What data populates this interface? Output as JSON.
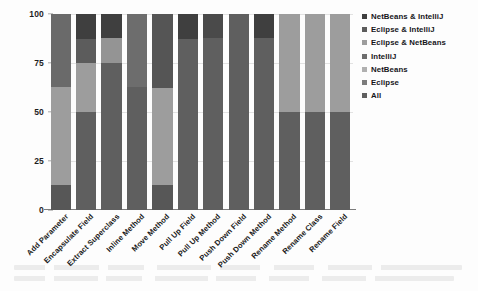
{
  "chart_data": {
    "type": "bar",
    "title": "",
    "subtitle": "",
    "xlabel": "",
    "ylabel": "",
    "ylim": [
      0,
      100
    ],
    "grid": true,
    "stacked": true,
    "stack_mode": "percent",
    "legend_position": "right",
    "orientation": "vertical",
    "yticks": [
      0,
      25,
      50,
      75,
      100
    ],
    "ytick_labels": [
      "0",
      "25",
      "50",
      "75",
      "100"
    ],
    "categories": [
      "Add Parameter",
      "Encapsulate Field",
      "Extract Superclass",
      "Inline Method",
      "Move Method",
      "Pull Up Field",
      "Pull Up Method",
      "Push Down Field",
      "Push Down Method",
      "Rename Method",
      "Rename Class",
      "Rename Field"
    ],
    "series": [
      {
        "name": "NetBeans & IntelliJ",
        "color": "#3a3a3a",
        "values": [
          0,
          13,
          12,
          0,
          0,
          13,
          0,
          0,
          12,
          0,
          0,
          0
        ]
      },
      {
        "name": "Eclipse & IntelliJ",
        "color": "#555555",
        "values": [
          0,
          12,
          0,
          0,
          0,
          0,
          0,
          0,
          0,
          0,
          0,
          0
        ]
      },
      {
        "name": "Eclipse & NetBeans",
        "color": "#9a9a9a",
        "values": [
          0,
          0,
          13,
          0,
          0,
          0,
          0,
          0,
          0,
          0,
          0,
          0
        ]
      },
      {
        "name": "IntelliJ",
        "color": "#6f6f6f",
        "values": [
          0,
          0,
          0,
          12,
          38,
          0,
          12,
          0,
          0,
          0,
          0,
          0
        ]
      },
      {
        "name": "NetBeans",
        "color": "#b4b4b4",
        "values": [
          0,
          0,
          0,
          0,
          0,
          0,
          0,
          0,
          0,
          0,
          0,
          0
        ]
      },
      {
        "name": "Eclipse",
        "color": "#8c8c8c",
        "values": [
          50,
          0,
          0,
          0,
          0,
          0,
          0,
          0,
          0,
          0,
          0,
          0
        ]
      },
      {
        "name": "All",
        "color": "#6a6a6a",
        "values": [
          50,
          75,
          75,
          88,
          62,
          87,
          88,
          100,
          88,
          100,
          100,
          100
        ]
      }
    ],
    "bars": [
      {
        "category": "Add Parameter",
        "segments": [
          {
            "series": "Eclipse",
            "value": 37,
            "from": 100,
            "to": 63,
            "color": "#6a6a6a"
          },
          {
            "series": "All",
            "value": 50,
            "from": 63,
            "to": 13,
            "color": "#9d9d9d"
          },
          {
            "series": "NetBeans & IntelliJ",
            "value": 13,
            "from": 13,
            "to": 0,
            "color": "#575757"
          }
        ]
      },
      {
        "category": "Encapsulate Field",
        "segments": [
          {
            "series": "NetBeans & IntelliJ",
            "value": 13,
            "from": 100,
            "to": 87,
            "color": "#3f3f3f"
          },
          {
            "series": "Eclipse & IntelliJ",
            "value": 12,
            "from": 87,
            "to": 75,
            "color": "#5c5c5c"
          },
          {
            "series": "Eclipse & NetBeans",
            "value": 25,
            "from": 75,
            "to": 50,
            "color": "#9d9d9d"
          },
          {
            "series": "All",
            "value": 50,
            "from": 50,
            "to": 0,
            "color": "#5f5f5f"
          }
        ]
      },
      {
        "category": "Extract Superclass",
        "segments": [
          {
            "series": "NetBeans & IntelliJ",
            "value": 12,
            "from": 100,
            "to": 88,
            "color": "#3f3f3f"
          },
          {
            "series": "Eclipse & NetBeans",
            "value": 13,
            "from": 88,
            "to": 75,
            "color": "#949494"
          },
          {
            "series": "All",
            "value": 75,
            "from": 75,
            "to": 0,
            "color": "#5f5f5f"
          }
        ]
      },
      {
        "category": "Inline Method",
        "segments": [
          {
            "series": "IntelliJ",
            "value": 37,
            "from": 100,
            "to": 63,
            "color": "#6d6d6d"
          },
          {
            "series": "All",
            "value": 63,
            "from": 63,
            "to": 0,
            "color": "#5f5f5f"
          }
        ]
      },
      {
        "category": "Move Method",
        "segments": [
          {
            "series": "IntelliJ",
            "value": 38,
            "from": 100,
            "to": 62,
            "color": "#555555"
          },
          {
            "series": "All",
            "value": 49,
            "from": 62,
            "to": 13,
            "color": "#9d9d9d"
          },
          {
            "series": "NetBeans & IntelliJ",
            "value": 13,
            "from": 13,
            "to": 0,
            "color": "#575757"
          }
        ]
      },
      {
        "category": "Pull Up Field",
        "segments": [
          {
            "series": "NetBeans & IntelliJ",
            "value": 13,
            "from": 100,
            "to": 87,
            "color": "#3f3f3f"
          },
          {
            "series": "All",
            "value": 87,
            "from": 87,
            "to": 0,
            "color": "#5f5f5f"
          }
        ]
      },
      {
        "category": "Pull Up Method",
        "segments": [
          {
            "series": "IntelliJ",
            "value": 12,
            "from": 100,
            "to": 88,
            "color": "#4a4a4a"
          },
          {
            "series": "All",
            "value": 88,
            "from": 88,
            "to": 0,
            "color": "#5f5f5f"
          }
        ]
      },
      {
        "category": "Push Down Field",
        "segments": [
          {
            "series": "All",
            "value": 100,
            "from": 100,
            "to": 0,
            "color": "#5f5f5f"
          }
        ]
      },
      {
        "category": "Push Down Method",
        "segments": [
          {
            "series": "NetBeans & IntelliJ",
            "value": 12,
            "from": 100,
            "to": 88,
            "color": "#3f3f3f"
          },
          {
            "series": "All",
            "value": 88,
            "from": 88,
            "to": 0,
            "color": "#5f5f5f"
          }
        ]
      },
      {
        "category": "Rename Method",
        "segments": [
          {
            "series": "Eclipse & NetBeans",
            "value": 50,
            "from": 100,
            "to": 50,
            "color": "#9d9d9d"
          },
          {
            "series": "All",
            "value": 50,
            "from": 50,
            "to": 0,
            "color": "#5f5f5f"
          }
        ]
      },
      {
        "category": "Rename Class",
        "segments": [
          {
            "series": "Eclipse & NetBeans",
            "value": 50,
            "from": 100,
            "to": 50,
            "color": "#9d9d9d"
          },
          {
            "series": "All",
            "value": 50,
            "from": 50,
            "to": 0,
            "color": "#5f5f5f"
          }
        ]
      },
      {
        "category": "Rename Field",
        "segments": [
          {
            "series": "Eclipse & NetBeans",
            "value": 50,
            "from": 100,
            "to": 50,
            "color": "#9d9d9d"
          },
          {
            "series": "All",
            "value": 50,
            "from": 50,
            "to": 0,
            "color": "#5f5f5f"
          }
        ]
      }
    ],
    "legend": [
      {
        "label": "NetBeans & IntelliJ",
        "color": "#3f3f3f"
      },
      {
        "label": "Eclipse & IntelliJ",
        "color": "#5c5c5c"
      },
      {
        "label": "Eclipse & NetBeans",
        "color": "#9d9d9d"
      },
      {
        "label": "IntelliJ",
        "color": "#6d6d6d"
      },
      {
        "label": "NetBeans",
        "color": "#b0b0b0"
      },
      {
        "label": "Eclipse",
        "color": "#7c7c7c"
      },
      {
        "label": "All",
        "color": "#5f5f5f"
      }
    ]
  }
}
